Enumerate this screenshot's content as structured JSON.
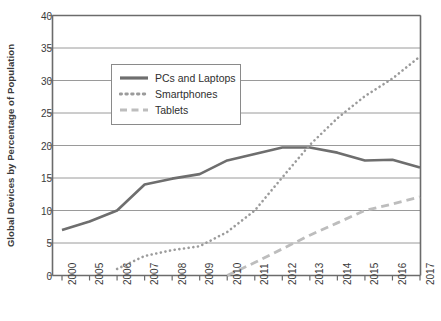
{
  "chart_data": {
    "type": "line",
    "title": "",
    "xlabel": "",
    "ylabel": "Global Devices by Percentage of Population",
    "categories": [
      "2000",
      "2005",
      "2006",
      "2007",
      "2008",
      "2009",
      "2010",
      "2011",
      "2012",
      "2013",
      "2014",
      "2015",
      "2016",
      "2017"
    ],
    "ylim": [
      0,
      40
    ],
    "yticks": [
      0,
      5,
      10,
      15,
      20,
      25,
      30,
      35,
      40
    ],
    "ytick_labels": [
      "0",
      "5",
      "10",
      "15",
      "20",
      "25",
      "30",
      "35",
      "40"
    ],
    "grid": true,
    "grid_axis": "y",
    "legend_position": "upper-left-inside",
    "series": [
      {
        "name": "PCs and Laptops",
        "style": "solid",
        "color": "#6e6e6e",
        "width": 2.6,
        "values": [
          7.0,
          8.3,
          10.0,
          14.0,
          14.9,
          15.6,
          17.7,
          18.7,
          19.7,
          19.7,
          18.9,
          17.7,
          17.8,
          16.6
        ]
      },
      {
        "name": "Smartphones",
        "style": "dotted",
        "color": "#9b9b9b",
        "width": 2.6,
        "values": [
          null,
          null,
          1.0,
          3.0,
          3.9,
          4.5,
          6.7,
          10.0,
          15.1,
          20.1,
          24.2,
          27.6,
          30.3,
          33.7
        ]
      },
      {
        "name": "Tablets",
        "style": "dashed",
        "color": "#bdbdbd",
        "width": 2.8,
        "values": [
          null,
          null,
          null,
          null,
          null,
          null,
          0.0,
          2.0,
          4.1,
          6.2,
          8.1,
          10.0,
          11.0,
          12.1
        ]
      }
    ]
  },
  "axes": {
    "y_title": "Global Devices by Percentage of Population"
  },
  "legend": {
    "items": [
      {
        "label": "PCs and Laptops",
        "icon": "solid-line-swatch"
      },
      {
        "label": "Smartphones",
        "icon": "dotted-line-swatch"
      },
      {
        "label": "Tablets",
        "icon": "dashed-line-swatch"
      }
    ]
  },
  "colors": {
    "pcs": "#6e6e6e",
    "smartphones": "#9b9b9b",
    "tablets": "#bdbdbd",
    "axis": "#6b6b6b",
    "grid": "#8f8f8f",
    "text": "#3a3a3a"
  }
}
